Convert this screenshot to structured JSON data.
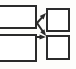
{
  "diagram": {
    "canvas": {
      "width": 76,
      "height": 69,
      "background_color": "#fdfdfb"
    },
    "style": {
      "stroke_color": "#2b2b2b",
      "stroke_width": 2,
      "node_fill": "#ffffff",
      "arrowhead_color": "#2b2b2b"
    },
    "nodes": [
      {
        "id": "node-top-left",
        "label": "",
        "shape": "rectangle",
        "x": -4,
        "y": 5,
        "width": 41,
        "height": 24,
        "clipped_edge": "left"
      },
      {
        "id": "node-bottom-left",
        "label": "",
        "shape": "rectangle",
        "x": -4,
        "y": 34,
        "width": 41,
        "height": 28,
        "clipped_edge": "left"
      },
      {
        "id": "node-top-right",
        "label": "",
        "shape": "rectangle",
        "x": 46,
        "y": 8,
        "width": 24,
        "height": 24,
        "clipped_edge": "none"
      },
      {
        "id": "node-bottom-right",
        "label": "",
        "shape": "rectangle",
        "x": 46,
        "y": 35,
        "width": 24,
        "height": 25,
        "clipped_edge": "none"
      }
    ],
    "edges": [
      {
        "id": "edge-topleft-to-topright",
        "from": "node-top-left",
        "to": "node-top-right",
        "label": "",
        "x1": 37,
        "y1": 23,
        "x2": 46,
        "y2": 13,
        "arrowhead": "filled-triangle",
        "direction": "up-right"
      },
      {
        "id": "edge-topleft-to-bottomright",
        "from": "node-top-left",
        "to": "node-bottom-right",
        "label": "",
        "x1": 37,
        "y1": 23,
        "x2": 46,
        "y2": 36,
        "arrowhead": "filled-triangle",
        "direction": "down-right"
      },
      {
        "id": "edge-bottomleft-to-bottomright",
        "from": "node-bottom-left",
        "to": "node-bottom-right",
        "label": "",
        "x1": 37,
        "y1": 37,
        "x2": 46,
        "y2": 37,
        "arrowhead": "filled-triangle",
        "direction": "right"
      }
    ]
  }
}
